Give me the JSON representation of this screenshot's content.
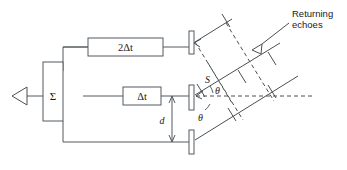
{
  "figure": {
    "background": "#ffffff",
    "line_color": "#4a4f53"
  },
  "blocks": {
    "summer_label": "Σ",
    "delay_top_label": "2Δt",
    "delay_mid_label": "Δt"
  },
  "labels": {
    "source_point": "S",
    "angle_upper": "θ",
    "angle_lower": "θ",
    "spacing": "d",
    "annotation_line1": "Returning",
    "annotation_line2": "echoes"
  },
  "elements": {
    "output_arrow_name": "output-signal-arrow",
    "transducer_top": "transducer-top",
    "transducer_mid": "transducer-middle",
    "transducer_bot": "transducer-bottom",
    "echo_arrow": "returning-echo-arrowhead"
  },
  "geometry": {
    "array_x": 192,
    "transducer_top_y": 40,
    "transducer_mid_y": 96,
    "transducer_bot_y": 142,
    "steer_angle_deg": 31,
    "centerline_y": 96
  }
}
